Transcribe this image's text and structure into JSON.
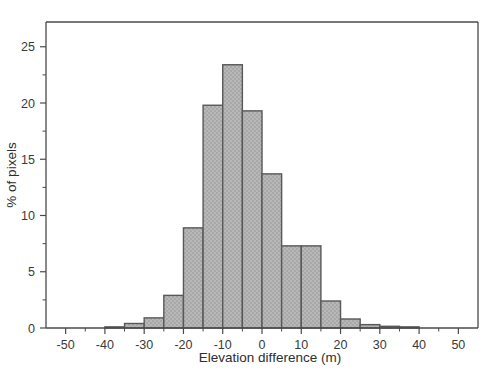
{
  "chart_data": {
    "type": "bar",
    "title": "",
    "subtitle": "",
    "xlabel": "Elevation difference (m)",
    "ylabel": "% of pixels",
    "xlim": [
      -55,
      55
    ],
    "ylim": [
      0,
      27.2
    ],
    "grid": false,
    "legend": null,
    "bin_width": 5,
    "x_ticks": [
      -50,
      -40,
      -30,
      -20,
      -10,
      0,
      10,
      20,
      30,
      40,
      50
    ],
    "x_tick_labels": [
      "-50",
      "-40",
      "-30",
      "-20",
      "-10",
      "0",
      "10",
      "20",
      "30",
      "40",
      "50"
    ],
    "x_minor_ticks": [
      -45,
      -35,
      -25,
      -15,
      -5,
      5,
      15,
      25,
      35,
      45
    ],
    "y_ticks": [
      0,
      5,
      10,
      15,
      20,
      25
    ],
    "y_tick_labels": [
      "0",
      "5",
      "10",
      "15",
      "20",
      "25"
    ],
    "y_minor_ticks": [
      2.5,
      7.5,
      12.5,
      17.5,
      22.5
    ],
    "bin_edges": [
      -40,
      -35,
      -30,
      -25,
      -20,
      -15,
      -10,
      -5,
      0,
      5,
      10,
      15,
      20,
      25,
      30,
      35,
      40
    ],
    "categories": [
      "-40 to -35",
      "-35 to -30",
      "-30 to -25",
      "-25 to -20",
      "-20 to -15",
      "-15 to -10",
      "-10 to -5",
      "-5 to 0",
      "0 to 5",
      "5 to 10",
      "10 to 15",
      "15 to 20",
      "20 to 25",
      "25 to 30",
      "30 to 35",
      "35 to 40"
    ],
    "bin_centers": [
      -37.5,
      -32.5,
      -27.5,
      -22.5,
      -17.5,
      -12.5,
      -7.5,
      -2.5,
      2.5,
      7.5,
      12.5,
      17.5,
      22.5,
      27.5,
      32.5,
      37.5
    ],
    "values": [
      0.1,
      0.4,
      0.9,
      2.9,
      8.9,
      19.8,
      23.4,
      19.3,
      13.7,
      7.3,
      7.3,
      2.4,
      0.8,
      0.3,
      0.15,
      0.1
    ],
    "bar_fill_color": "#b4b4b4",
    "bar_edge_color": "#585858",
    "axis_color": "#4a4a4a",
    "text_color": "#333333",
    "background_color": "#ffffff"
  }
}
